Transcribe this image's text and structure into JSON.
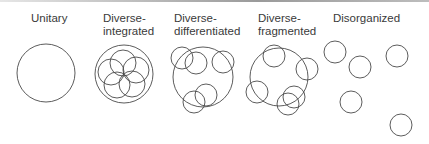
{
  "labels": [
    {
      "id": "unitary",
      "line1": "Unitary",
      "line2": "",
      "x": 31,
      "y": 12
    },
    {
      "id": "diverse-integrated",
      "line1": "Diverse-",
      "line2": "integrated",
      "x": 103,
      "y": 12
    },
    {
      "id": "diverse-differentiated",
      "line1": "Diverse-",
      "line2": "differentiated",
      "x": 174,
      "y": 12
    },
    {
      "id": "diverse-fragmented",
      "line1": "Diverse-",
      "line2": "fragmented",
      "x": 258,
      "y": 12
    },
    {
      "id": "disorganized",
      "line1": "Disorganized",
      "line2": "",
      "x": 333,
      "y": 12
    }
  ],
  "diagrams": [
    {
      "id": "unitary",
      "circles": [
        [
          46,
          73,
          29
        ]
      ]
    },
    {
      "id": "diverse-integrated",
      "circles": [
        [
          124,
          74,
          29
        ],
        [
          123,
          63,
          13
        ],
        [
          136,
          70,
          13
        ],
        [
          132,
          84,
          13
        ],
        [
          117,
          85,
          13
        ],
        [
          111,
          72,
          13
        ]
      ]
    },
    {
      "id": "diverse-differentiated",
      "circles": [
        [
          203,
          77,
          30
        ],
        [
          182,
          58,
          11
        ],
        [
          196,
          63,
          11
        ],
        [
          223,
          62,
          11
        ],
        [
          206,
          95,
          11
        ],
        [
          194,
          102,
          11
        ]
      ]
    },
    {
      "id": "diverse-fragmented",
      "circles": [
        [
          279,
          77,
          29
        ],
        [
          274,
          56,
          11
        ],
        [
          307,
          69,
          11
        ],
        [
          257,
          92,
          11
        ],
        [
          294,
          97,
          11
        ],
        [
          288,
          104,
          11
        ]
      ]
    },
    {
      "id": "disorganized",
      "circles": [
        [
          335,
          52,
          11
        ],
        [
          360,
          67,
          11
        ],
        [
          397,
          56,
          11
        ],
        [
          351,
          102,
          11
        ],
        [
          401,
          125,
          11
        ]
      ]
    }
  ],
  "style": {
    "stroke": "#4a4a4a",
    "text": "#3a3a3a"
  }
}
